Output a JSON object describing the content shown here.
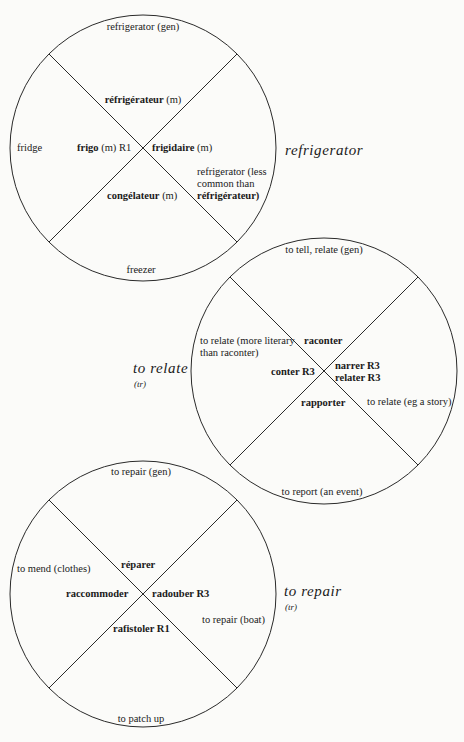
{
  "diagrams": [
    {
      "id": "refrigerator",
      "title": "refrigerator",
      "subtitle": "",
      "circle": {
        "cx": 143,
        "cy": 148,
        "r": 133
      },
      "labels": {
        "top": "refrigerator (gen)",
        "left": "fridge",
        "right": [
          "refrigerator (less",
          "common than",
          "réfrigérateur)"
        ],
        "bottom": "freezer"
      },
      "terms": {
        "north": "réfrigérateur",
        "north_note": "(m)",
        "west": "frigo",
        "west_note": "(m) R1",
        "east": "frigidaire",
        "east_note": "(m)",
        "south": "congélateur",
        "south_note": "(m)"
      }
    },
    {
      "id": "to-relate",
      "title": "to relate",
      "subtitle": "(tr)",
      "circle": {
        "cx": 324,
        "cy": 371,
        "r": 133
      },
      "labels": {
        "top": "to tell, relate (gen)",
        "left": [
          "to relate (more literary",
          "than raconter)"
        ],
        "right": "to relate (eg a story)",
        "bottom": "to report (an event)"
      },
      "terms": {
        "north": "raconter",
        "west": "conter R3",
        "east": [
          "narrer R3",
          "relater R3"
        ],
        "south": "rapporter"
      }
    },
    {
      "id": "to-repair",
      "title": "to repair",
      "subtitle": "(tr)",
      "circle": {
        "cx": 143,
        "cy": 594,
        "r": 133
      },
      "labels": {
        "top": "to repair (gen)",
        "left": "to mend (clothes)",
        "right": "to repair (boat)",
        "bottom": "to patch up"
      },
      "terms": {
        "north": "réparer",
        "west": "raccommoder",
        "east": "radouber R3",
        "south": "rafistoler R1"
      }
    }
  ],
  "colors": {
    "background": "#fbfbf9",
    "ink": "#1a1a1a"
  }
}
